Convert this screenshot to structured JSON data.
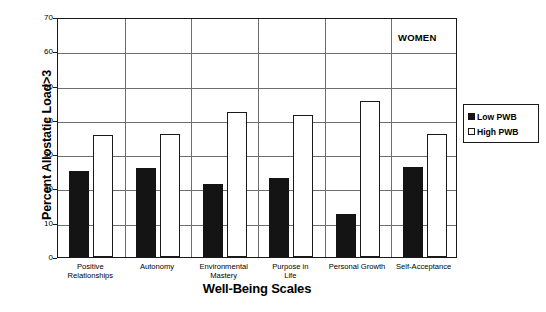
{
  "chart_data": {
    "type": "bar",
    "title": "",
    "annotation": "WOMEN",
    "xlabel": "Well-Being Scales",
    "ylabel": "Percent Allostatic Load>3",
    "ylim": [
      0,
      70
    ],
    "ytick_step": 10,
    "yticks": [
      0,
      10,
      20,
      30,
      40,
      50,
      60,
      70
    ],
    "grid": true,
    "legend_position": "right",
    "categories": [
      "Positive Relationships",
      "Autonomy",
      "Environmental Mastery",
      "Purpose in Life",
      "Personal Growth",
      "Self-Acceptance"
    ],
    "category_lines": [
      [
        "Positive",
        "Relationships"
      ],
      [
        "Autonomy",
        ""
      ],
      [
        "Environmental",
        "Mastery"
      ],
      [
        "Purpose in",
        "Life"
      ],
      [
        "Personal Growth",
        ""
      ],
      [
        "Self-Acceptance",
        ""
      ]
    ],
    "series": [
      {
        "name": "Low PWB",
        "color": "#141414",
        "values": [
          25.1,
          26.0,
          21.2,
          23.0,
          12.6,
          26.4
        ]
      },
      {
        "name": "High PWB",
        "color": "#ffffff",
        "values": [
          35.6,
          36.0,
          42.3,
          41.5,
          45.6,
          35.8
        ]
      }
    ]
  },
  "legend": {
    "items": [
      {
        "label": "Low PWB",
        "swatch": "filled-square"
      },
      {
        "label": "High PWB",
        "swatch": "open-square"
      }
    ]
  },
  "colors": {
    "low_pwb": "#141414",
    "high_pwb": "#ffffff",
    "axis": "#1a1a1a",
    "grid": "#6e6e6e",
    "background": "#ffffff"
  }
}
